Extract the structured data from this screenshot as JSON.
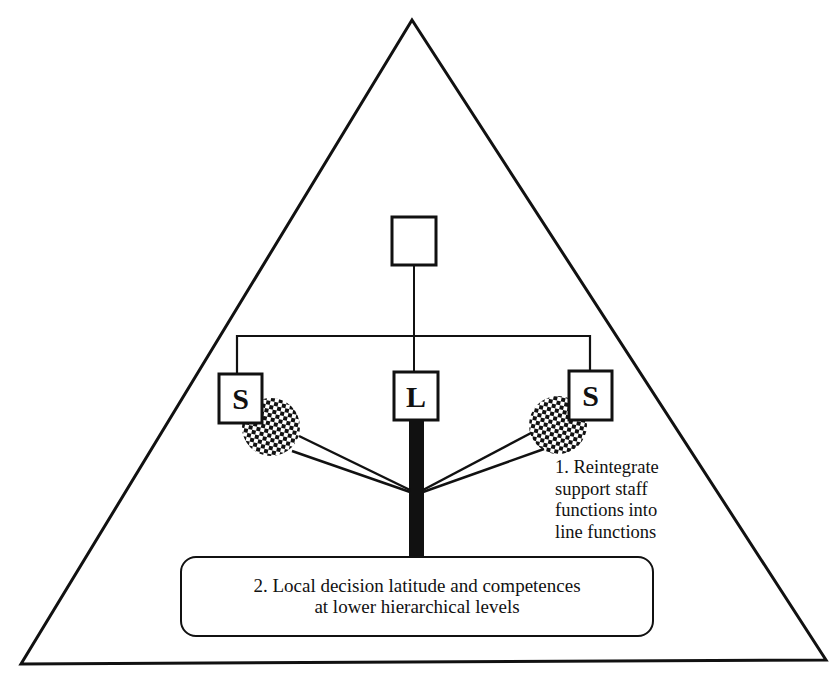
{
  "diagram": {
    "type": "organizational-structure",
    "colors": {
      "ink": "#111111",
      "background": "#ffffff"
    },
    "boxes": {
      "top": {
        "label": ""
      },
      "staff_left": {
        "label": "S"
      },
      "line": {
        "label": "L"
      },
      "staff_right": {
        "label": "S"
      }
    },
    "annotations": {
      "note1": {
        "lines": [
          "1. Reintegrate",
          "support staff",
          "functions into",
          "line functions"
        ]
      },
      "note2": {
        "lines": [
          "2. Local decision latitude and competences",
          "at lower hierarchical levels"
        ]
      }
    }
  }
}
